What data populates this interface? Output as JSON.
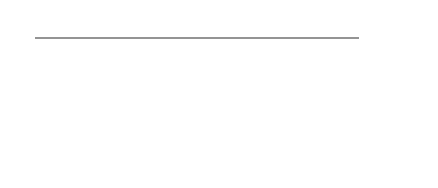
{
  "vcc_label": "Vcc",
  "colors": {
    "line": "#2a2a2a",
    "background": "#ffffff"
  },
  "geometry": {
    "top_bus_y": 38,
    "bottom_bus_y": 148,
    "junction_y": 92,
    "upper_resistor": [
      50,
      74
    ],
    "lower_resistor": [
      114,
      138
    ],
    "bus_left_x": 35,
    "top_bus_right_x": 359,
    "bottom_bus_right_x": 407
  },
  "columns": [
    57,
    81,
    104,
    127,
    150,
    173,
    196,
    219,
    242,
    265,
    288,
    311,
    334,
    357
  ],
  "top_pins": [
    {
      "label": "16",
      "x": 35,
      "y": 30,
      "label_x": 6,
      "label_y": 32,
      "is_vcc": true
    },
    {
      "label": "15",
      "x": 69,
      "y": 30,
      "label_x": 63,
      "label_y": 18,
      "col": 0
    },
    {
      "label": "14",
      "x": 116,
      "y": 30,
      "label_x": 110,
      "label_y": 18,
      "col": 2
    },
    {
      "label": "13",
      "x": 162,
      "y": 30,
      "label_x": 156,
      "label_y": 18,
      "col": 4
    },
    {
      "label": "12",
      "x": 208,
      "y": 30,
      "label_x": 202,
      "label_y": 18,
      "col": 6
    },
    {
      "label": "11",
      "x": 254,
      "y": 30,
      "label_x": 248,
      "label_y": 18,
      "col": 8
    },
    {
      "label": "10",
      "x": 301,
      "y": 30,
      "label_x": 295,
      "label_y": 18,
      "col": 10
    },
    {
      "label": "9",
      "x": 348,
      "y": 30,
      "label_x": 345,
      "label_y": 18,
      "col": 12
    }
  ],
  "bottom_pins": [
    {
      "label": "1",
      "x": 93,
      "y": 160,
      "label_x": 93,
      "label_y": 178,
      "col": 1
    },
    {
      "label": "2",
      "x": 139,
      "y": 160,
      "label_x": 139,
      "label_y": 178,
      "col": 3
    },
    {
      "label": "3",
      "x": 185,
      "y": 160,
      "label_x": 185,
      "label_y": 178,
      "col": 5
    },
    {
      "label": "4",
      "x": 232,
      "y": 160,
      "label_x": 232,
      "label_y": 178,
      "col": 7
    },
    {
      "label": "5",
      "x": 278,
      "y": 160,
      "label_x": 278,
      "label_y": 178,
      "col": 9
    },
    {
      "label": "6",
      "x": 324,
      "y": 160,
      "label_x": 324,
      "label_y": 178,
      "col": 11
    },
    {
      "label": "7",
      "x": 370,
      "y": 160,
      "label_x": 370,
      "label_y": 178,
      "col": 13
    }
  ],
  "ground_pin": {
    "label": "8",
    "x": 407,
    "y": 149,
    "label_x": 416,
    "label_y": 146
  }
}
